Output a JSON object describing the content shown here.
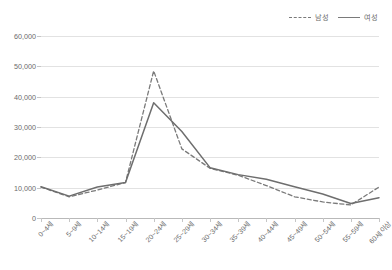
{
  "chart_data": {
    "type": "line",
    "title": "",
    "subtitle": "",
    "xlabel": "",
    "ylabel": "",
    "ylim": [
      0,
      60000
    ],
    "yticks": [
      "0",
      "10,000",
      "20,000",
      "30,000",
      "40,000",
      "50,000",
      "60,000"
    ],
    "ytick_values": [
      0,
      10000,
      20000,
      30000,
      40000,
      50000,
      60000
    ],
    "grid": "horizontal",
    "legend_position": "top-right",
    "categories": [
      "0~4세",
      "5~9세",
      "10~14세",
      "15~19세",
      "20~24세",
      "25~29세",
      "30~34세",
      "35~39세",
      "40~44세",
      "45~49세",
      "50~54세",
      "55~59세",
      "60세 이상"
    ],
    "series": [
      {
        "name": "남성",
        "style": "dashed",
        "color": "#7a7a7a",
        "values": [
          10200,
          7000,
          9200,
          11700,
          48500,
          22800,
          16400,
          14100,
          10700,
          7000,
          5300,
          4300,
          10200
        ]
      },
      {
        "name": "여성",
        "style": "solid",
        "color": "#6e6e6e",
        "values": [
          10300,
          7200,
          10200,
          11700,
          38000,
          28500,
          16600,
          14300,
          12800,
          10300,
          7900,
          4800,
          6700
        ]
      }
    ]
  },
  "legend": {
    "items": [
      {
        "label": "남성",
        "style": "dashed"
      },
      {
        "label": "여성",
        "style": "solid"
      }
    ]
  },
  "colors": {
    "background": "#ffffff",
    "gridline": "#e2e2e2",
    "axis": "#b9b9b9",
    "tick_text": "#6b6b6b",
    "male_line": "#7a7a7a",
    "female_line": "#6e6e6e"
  }
}
